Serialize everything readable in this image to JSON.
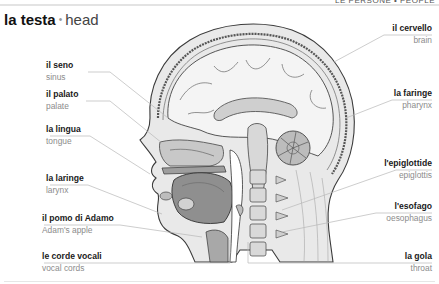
{
  "page": {
    "section_header": "LE PERSONE • PEOPLE",
    "title": {
      "italian": "la testa",
      "separator": "•",
      "english": "head"
    }
  },
  "labels": {
    "left": [
      {
        "italian": "il seno",
        "english": "sinus"
      },
      {
        "italian": "il palato",
        "english": "palate"
      },
      {
        "italian": "la lingua",
        "english": "tongue"
      },
      {
        "italian": "la laringe",
        "english": "larynx"
      },
      {
        "italian": "il pomo di Adamo",
        "english": "Adam's apple"
      },
      {
        "italian": "le corde vocali",
        "english": "vocal cords"
      }
    ],
    "right": [
      {
        "italian": "il cervello",
        "english": "brain"
      },
      {
        "italian": "la faringe",
        "english": "pharynx"
      },
      {
        "italian": "l'epiglottide",
        "english": "epiglottis"
      },
      {
        "italian": "l'esofago",
        "english": "oesophagus"
      },
      {
        "italian": "la gola",
        "english": "throat"
      }
    ]
  },
  "illustration": {
    "subject": "sagittal cross-section of human head and neck",
    "colors": {
      "outline": "#3a3a3a",
      "shade_dark": "#8a8a8a",
      "shade_mid": "#bdbdbd",
      "shade_light": "#e4e4e4",
      "leader_line": "#b8b8b8"
    }
  }
}
